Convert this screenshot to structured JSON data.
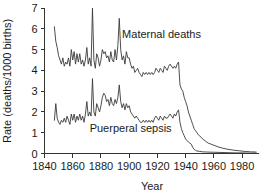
{
  "chart_data": {
    "type": "line",
    "title": "",
    "xlabel": "Year",
    "ylabel": "Rate (deaths/1000 births)",
    "xlim": [
      1840,
      1992
    ],
    "ylim": [
      0,
      7
    ],
    "xticks": [
      1840,
      1860,
      1880,
      1900,
      1920,
      1940,
      1960,
      1980
    ],
    "yticks": [
      0,
      1,
      2,
      3,
      4,
      5,
      6,
      7
    ],
    "grid": false,
    "legend_position": "inline-annotation",
    "annotations": [
      {
        "text": "Maternal deaths",
        "x": 1895,
        "y": 5.55
      },
      {
        "text": "Puerperal sepsis",
        "x": 1872,
        "y": 1.05
      }
    ],
    "series": [
      {
        "name": "Maternal deaths",
        "x": [
          1847,
          1848,
          1849,
          1850,
          1851,
          1852,
          1853,
          1854,
          1855,
          1856,
          1857,
          1858,
          1859,
          1860,
          1861,
          1862,
          1863,
          1864,
          1865,
          1866,
          1867,
          1868,
          1869,
          1870,
          1871,
          1872,
          1873,
          1874,
          1875,
          1876,
          1877,
          1878,
          1879,
          1880,
          1881,
          1882,
          1883,
          1884,
          1885,
          1886,
          1887,
          1888,
          1889,
          1890,
          1891,
          1892,
          1893,
          1894,
          1895,
          1896,
          1897,
          1898,
          1899,
          1900,
          1901,
          1902,
          1903,
          1904,
          1905,
          1906,
          1907,
          1908,
          1909,
          1910,
          1911,
          1912,
          1913,
          1914,
          1915,
          1916,
          1917,
          1918,
          1919,
          1920,
          1921,
          1922,
          1923,
          1924,
          1925,
          1926,
          1927,
          1928,
          1929,
          1930,
          1931,
          1932,
          1933,
          1934,
          1935,
          1936,
          1937,
          1938,
          1939,
          1940,
          1941,
          1942,
          1943,
          1944,
          1945,
          1946,
          1947,
          1948,
          1949,
          1950,
          1952,
          1954,
          1956,
          1958,
          1960,
          1963,
          1966,
          1970,
          1974,
          1978,
          1982,
          1986,
          1990
        ],
        "y": [
          6.1,
          5.4,
          5.1,
          4.7,
          4.5,
          4.3,
          4.6,
          4.2,
          4.4,
          4.3,
          4.6,
          4.2,
          5.0,
          4.5,
          4.9,
          4.3,
          4.8,
          4.4,
          4.8,
          4.3,
          4.5,
          4.2,
          4.5,
          5.1,
          4.3,
          4.6,
          4.2,
          7.0,
          4.5,
          4.1,
          4.8,
          4.6,
          4.2,
          4.5,
          5.0,
          4.8,
          4.9,
          4.6,
          4.7,
          4.4,
          4.9,
          4.5,
          4.4,
          5.0,
          4.5,
          5.2,
          6.5,
          5.0,
          4.5,
          4.7,
          4.3,
          4.9,
          4.6,
          4.6,
          4.3,
          4.1,
          4.2,
          3.9,
          4.0,
          4.1,
          3.9,
          3.8,
          3.7,
          3.9,
          3.8,
          3.9,
          3.8,
          3.9,
          3.8,
          3.9,
          3.8,
          3.9,
          4.1,
          4.0,
          3.9,
          4.1,
          4.0,
          3.9,
          4.2,
          4.1,
          4.0,
          4.2,
          4.3,
          4.2,
          4.1,
          4.2,
          4.1,
          4.3,
          4.4,
          3.3,
          3.1,
          3.0,
          2.7,
          2.5,
          2.3,
          2.0,
          1.8,
          1.6,
          1.4,
          1.2,
          1.1,
          1.0,
          0.9,
          0.85,
          0.7,
          0.6,
          0.5,
          0.45,
          0.4,
          0.32,
          0.26,
          0.2,
          0.16,
          0.13,
          0.1,
          0.08,
          0.07
        ]
      },
      {
        "name": "Puerperal sepsis",
        "x": [
          1847,
          1848,
          1849,
          1850,
          1851,
          1852,
          1853,
          1854,
          1855,
          1856,
          1857,
          1858,
          1859,
          1860,
          1861,
          1862,
          1863,
          1864,
          1865,
          1866,
          1867,
          1868,
          1869,
          1870,
          1871,
          1872,
          1873,
          1874,
          1875,
          1876,
          1877,
          1878,
          1879,
          1880,
          1881,
          1882,
          1883,
          1884,
          1885,
          1886,
          1887,
          1888,
          1889,
          1890,
          1891,
          1892,
          1893,
          1894,
          1895,
          1896,
          1897,
          1898,
          1899,
          1900,
          1901,
          1902,
          1903,
          1904,
          1905,
          1906,
          1907,
          1908,
          1909,
          1910,
          1911,
          1912,
          1913,
          1914,
          1915,
          1916,
          1917,
          1918,
          1919,
          1920,
          1921,
          1922,
          1923,
          1924,
          1925,
          1926,
          1927,
          1928,
          1929,
          1930,
          1931,
          1932,
          1933,
          1934,
          1935,
          1936,
          1937,
          1938,
          1939,
          1940,
          1941,
          1942,
          1943,
          1944,
          1945,
          1946,
          1947,
          1948,
          1950,
          1952,
          1955,
          1960,
          1965,
          1970,
          1975,
          1980,
          1985,
          1990
        ],
        "y": [
          1.6,
          2.4,
          1.7,
          1.5,
          1.4,
          1.6,
          1.5,
          1.7,
          1.5,
          1.8,
          1.6,
          1.4,
          1.9,
          1.6,
          1.9,
          1.5,
          1.8,
          1.6,
          1.9,
          1.6,
          1.8,
          1.5,
          1.9,
          2.5,
          1.8,
          2.0,
          1.8,
          3.6,
          2.0,
          1.8,
          2.4,
          2.2,
          2.0,
          2.3,
          2.7,
          2.9,
          2.8,
          2.5,
          2.6,
          2.3,
          2.7,
          2.4,
          2.3,
          2.6,
          2.4,
          2.7,
          3.3,
          2.5,
          2.2,
          2.4,
          2.1,
          2.4,
          2.2,
          2.3,
          2.0,
          1.9,
          1.8,
          1.7,
          1.8,
          1.7,
          1.6,
          1.5,
          1.5,
          1.6,
          1.5,
          1.6,
          1.5,
          1.6,
          1.5,
          1.6,
          1.5,
          1.7,
          1.8,
          1.7,
          1.6,
          1.8,
          1.7,
          1.6,
          1.8,
          1.7,
          1.7,
          1.8,
          1.9,
          1.8,
          1.7,
          1.9,
          1.8,
          2.0,
          2.1,
          1.5,
          1.2,
          1.0,
          0.85,
          0.7,
          0.62,
          0.55,
          0.5,
          0.45,
          0.3,
          0.2,
          0.15,
          0.12,
          0.1,
          0.08,
          0.07,
          0.06,
          0.05,
          0.04,
          0.03,
          0.03,
          0.02,
          0.02
        ]
      }
    ]
  },
  "colors": {
    "line": "#3a3a3a",
    "axis": "#333333",
    "text": "#1a1a1a",
    "background": "#ffffff"
  }
}
